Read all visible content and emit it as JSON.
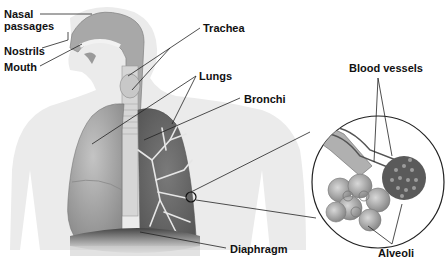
{
  "diagram": {
    "labels": {
      "nasal_line1": "Nasal",
      "nasal_line2": "passages",
      "nostrils": "Nostrils",
      "mouth": "Mouth",
      "trachea": "Trachea",
      "lungs": "Lungs",
      "bronchi": "Bronchi",
      "blood_vessels": "Blood vessels",
      "alveoli": "Alveoli",
      "diaphragm": "Diaphragm"
    },
    "colors": {
      "silhouette": "#ececec",
      "lung_light": "#b8b8b8",
      "lung_dark": "#6e6e6e",
      "bronchi": "#e4e4e4",
      "leader_line": "#222222"
    }
  }
}
